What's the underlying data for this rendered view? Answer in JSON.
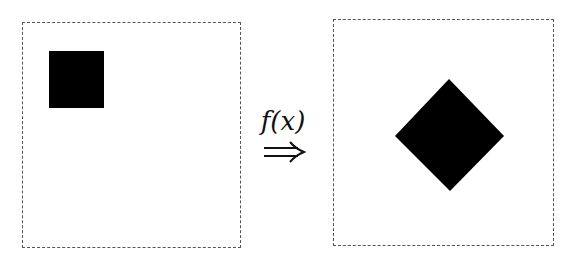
{
  "figure": {
    "label": "f(x)",
    "arrow_symbol": "double-right-arrow",
    "left_panel": {
      "shape": "square",
      "color": "#000000",
      "position": "top-left"
    },
    "right_panel": {
      "shape": "diamond",
      "color": "#000000",
      "position": "center"
    },
    "frame_style": "dashed"
  }
}
